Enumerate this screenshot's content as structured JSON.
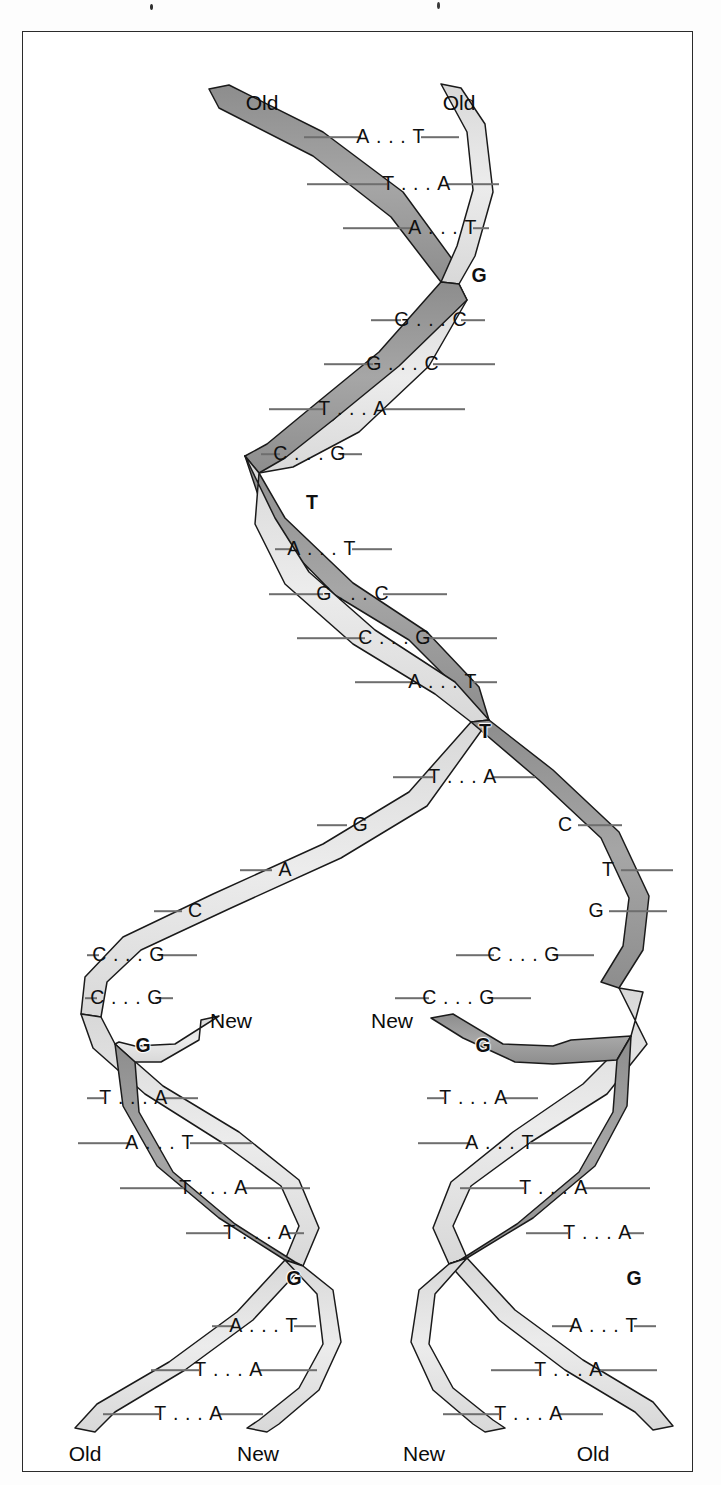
{
  "figure": {
    "kind": "dna-replication-fork-diagram",
    "frame": {
      "border_color": "#2b2b2b",
      "background": "#ffffff"
    },
    "colors": {
      "strand_dark": "#9a9a9a",
      "strand_light": "#e0e0e0",
      "strand_outline": "#1a1a1a",
      "rung_line": "#6e6e6e",
      "text": "#101010"
    }
  },
  "end_labels": {
    "parent_left": {
      "text": "Old",
      "x": 239,
      "y": 70
    },
    "parent_right": {
      "text": "Old",
      "x": 436,
      "y": 70
    },
    "fork_new_left": {
      "text": "New",
      "x": 208,
      "y": 988
    },
    "fork_new_right": {
      "text": "New",
      "x": 369,
      "y": 988
    },
    "bottom_old_left": {
      "text": "Old",
      "x": 62,
      "y": 1421
    },
    "bottom_new_left": {
      "text": "New",
      "x": 235,
      "y": 1421
    },
    "bottom_new_right": {
      "text": "New",
      "x": 401,
      "y": 1421
    },
    "bottom_old_right": {
      "text": "Old",
      "x": 570,
      "y": 1421
    }
  },
  "parent_helix": {
    "description": "Original double helix, both strands labelled Old",
    "rungs": [
      {
        "left": "A",
        "right": "T",
        "paired": true,
        "x": 368,
        "y": 105,
        "tick_left": 57,
        "tick_right": 38
      },
      {
        "left": "T",
        "right": "A",
        "paired": true,
        "x": 394,
        "y": 152,
        "tick_left": 80,
        "tick_right": 52
      },
      {
        "left": "A",
        "right": "T",
        "paired": true,
        "x": 420,
        "y": 196,
        "tick_left": 70,
        "tick_right": 16
      },
      {
        "left": "G",
        "right": "",
        "paired": false,
        "crossover": true,
        "x": 456,
        "y": 244
      },
      {
        "left": "G",
        "right": "C",
        "paired": true,
        "x": 408,
        "y": 288,
        "tick_left": 30,
        "tick_right": 24
      },
      {
        "left": "G",
        "right": "C",
        "paired": true,
        "x": 380,
        "y": 332,
        "tick_left": 49,
        "tick_right": 62
      },
      {
        "left": "T",
        "right": "A",
        "paired": true,
        "x": 330,
        "y": 377,
        "tick_left": 54,
        "tick_right": 82
      },
      {
        "left": "C",
        "right": "G",
        "paired": true,
        "x": 287,
        "y": 422,
        "tick_left": 19,
        "tick_right": 22
      },
      {
        "left": "T",
        "right": "",
        "paired": false,
        "crossover": true,
        "x": 289,
        "y": 471
      },
      {
        "left": "A",
        "right": "T",
        "paired": true,
        "x": 299,
        "y": 517,
        "tick_left": 17,
        "tick_right": 40
      },
      {
        "left": "G",
        "right": "C",
        "paired": true,
        "x": 330,
        "y": 562,
        "tick_left": 54,
        "tick_right": 64
      },
      {
        "left": "C",
        "right": "G",
        "paired": true,
        "x": 372,
        "y": 606,
        "tick_left": 68,
        "tick_right": 72
      },
      {
        "left": "A",
        "right": "T",
        "paired": true,
        "x": 420,
        "y": 650,
        "tick_left": 58,
        "tick_right": 24
      },
      {
        "left": "T",
        "right": "",
        "paired": false,
        "crossover": true,
        "x": 462,
        "y": 700
      },
      {
        "left": "T",
        "right": "A",
        "paired": true,
        "x": 440,
        "y": 745,
        "tick_left": 40,
        "tick_right": 42
      }
    ]
  },
  "fork": {
    "description": "Replication fork: parent strands separated, unpaired bases exposed",
    "left_unpaired": [
      {
        "base": "G",
        "x": 337,
        "y": 793,
        "tick_side": "left",
        "tick_len": 30
      },
      {
        "base": "A",
        "x": 262,
        "y": 838,
        "tick_side": "left",
        "tick_len": 32
      },
      {
        "base": "C",
        "x": 172,
        "y": 879,
        "tick_side": "left",
        "tick_len": 28
      }
    ],
    "left_paired": [
      {
        "left": "C",
        "right": "G",
        "x": 106,
        "y": 923,
        "tick_left": 12,
        "tick_right": 38
      },
      {
        "left": "C",
        "right": "G",
        "x": 104,
        "y": 966,
        "tick_left": 12,
        "tick_right": 16
      }
    ],
    "right_unpaired": [
      {
        "base": "C",
        "x": 542,
        "y": 793,
        "tick_side": "right",
        "tick_len": 44
      },
      {
        "base": "T",
        "x": 585,
        "y": 838,
        "tick_side": "right",
        "tick_len": 52
      },
      {
        "base": "G",
        "x": 573,
        "y": 879,
        "tick_side": "right",
        "tick_len": 58
      }
    ],
    "right_paired": [
      {
        "left": "C",
        "right": "G",
        "x": 501,
        "y": 923,
        "tick_left": 38,
        "tick_right": 40
      },
      {
        "left": "C",
        "right": "G",
        "x": 436,
        "y": 966,
        "tick_left": 34,
        "tick_right": 42
      }
    ]
  },
  "daughter_left": {
    "description": "Left daughter helix: Old template strand + New strand",
    "rungs": [
      {
        "left": "G",
        "right": "",
        "paired": false,
        "crossover": true,
        "x": 120,
        "y": 1014
      },
      {
        "left": "T",
        "right": "A",
        "paired": true,
        "x": 111,
        "y": 1066,
        "tick_left": 17,
        "tick_right": 34
      },
      {
        "left": "A",
        "right": "T",
        "paired": true,
        "x": 137,
        "y": 1111,
        "tick_left": 52,
        "tick_right": 62
      },
      {
        "left": "T",
        "right": "A",
        "paired": true,
        "x": 191,
        "y": 1156,
        "tick_left": 64,
        "tick_right": 66
      },
      {
        "left": "T",
        "right": "A",
        "paired": true,
        "x": 235,
        "y": 1201,
        "tick_left": 42,
        "tick_right": 16
      },
      {
        "left": "G",
        "right": "",
        "paired": false,
        "crossover": true,
        "x": 271,
        "y": 1247
      },
      {
        "left": "A",
        "right": "T",
        "paired": true,
        "x": 241,
        "y": 1294,
        "tick_left": 22,
        "tick_right": 22
      },
      {
        "left": "T",
        "right": "A",
        "paired": true,
        "x": 206,
        "y": 1338,
        "tick_left": 48,
        "tick_right": 58
      },
      {
        "left": "T",
        "right": "A",
        "paired": true,
        "x": 166,
        "y": 1382,
        "tick_left": 56,
        "tick_right": 44
      }
    ]
  },
  "daughter_right": {
    "description": "Right daughter helix: New strand + Old template strand",
    "rungs": [
      {
        "left": "G",
        "right": "",
        "paired": false,
        "crossover": true,
        "x": 460,
        "y": 1014
      },
      {
        "left": "T",
        "right": "A",
        "paired": true,
        "x": 451,
        "y": 1066,
        "tick_left": 17,
        "tick_right": 34
      },
      {
        "left": "A",
        "right": "T",
        "paired": true,
        "x": 477,
        "y": 1111,
        "tick_left": 52,
        "tick_right": 62
      },
      {
        "left": "T",
        "right": "A",
        "paired": true,
        "x": 531,
        "y": 1156,
        "tick_left": 64,
        "tick_right": 66
      },
      {
        "left": "T",
        "right": "A",
        "paired": true,
        "x": 575,
        "y": 1201,
        "tick_left": 42,
        "tick_right": 16
      },
      {
        "left": "G",
        "right": "",
        "paired": false,
        "crossover": true,
        "x": 611,
        "y": 1247
      },
      {
        "left": "A",
        "right": "T",
        "paired": true,
        "x": 581,
        "y": 1294,
        "tick_left": 22,
        "tick_right": 22
      },
      {
        "left": "T",
        "right": "A",
        "paired": true,
        "x": 546,
        "y": 1338,
        "tick_left": 48,
        "tick_right": 58
      },
      {
        "left": "T",
        "right": "A",
        "paired": true,
        "x": 506,
        "y": 1382,
        "tick_left": 56,
        "tick_right": 44
      }
    ]
  }
}
